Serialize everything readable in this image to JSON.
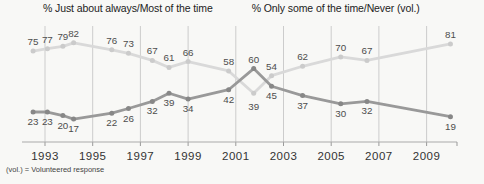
{
  "footnote": "(vol.) = Volunteered response",
  "chart_data": {
    "type": "line",
    "legend_position": "top",
    "grid": "vertical",
    "x_axis": {
      "tick_labels": [
        "1993",
        "1995",
        "1997",
        "1999",
        "2001",
        "2003",
        "2005",
        "2007",
        "2009"
      ],
      "tick_years": [
        1993,
        1995,
        1997,
        1999,
        2001,
        2003,
        2005,
        2007,
        2009
      ],
      "xlim": [
        1992,
        2010.8
      ]
    },
    "y_axis": {
      "ylim": [
        0,
        96
      ],
      "visible": false
    },
    "x": [
      1992.5,
      1993.1,
      1993.75,
      1994.2,
      1995.8,
      1996.5,
      1997.5,
      1998.2,
      1999.0,
      2000.7,
      2001.75,
      2002.5,
      2003.8,
      2005.4,
      2006.5,
      2010.0
    ],
    "series": [
      {
        "name": "% Just about always/Most of the time",
        "color": "#999999",
        "dot_color": "#878787",
        "values": [
          23,
          23,
          20,
          17,
          22,
          26,
          32,
          39,
          34,
          42,
          60,
          45,
          37,
          30,
          32,
          19
        ],
        "label_side_default": "below",
        "label_overrides": {
          "10": {
            "side": "above"
          }
        }
      },
      {
        "name": "% Only some of the time/Never (vol.)",
        "color": "#d9d9d9",
        "dot_color": "#cbcbcb",
        "values": [
          75,
          77,
          79,
          82,
          76,
          73,
          67,
          61,
          66,
          58,
          39,
          54,
          62,
          70,
          67,
          81
        ],
        "label_side_default": "above",
        "label_overrides": {
          "10": {
            "side": "below",
            "extra": 4
          }
        }
      }
    ],
    "colors": {
      "grid": "#cccccc",
      "axis": "#aaaaaa",
      "tick": "#999999",
      "data_label": "#4d4d4d",
      "year_label": "#333333"
    }
  }
}
